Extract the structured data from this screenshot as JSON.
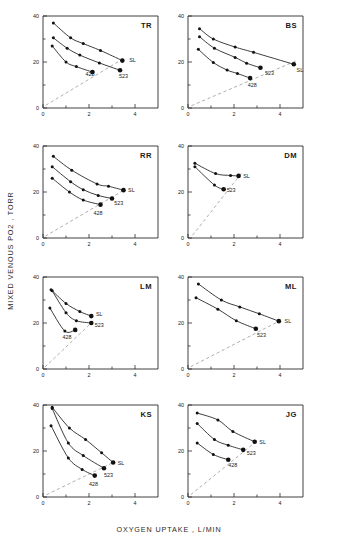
{
  "figure": {
    "xlabel": "OXYGEN UPTAKE , L/MIN",
    "ylabel": "MIXED VENOUS PO2 , TORR",
    "axis_color": "#2b2b2b",
    "marker_color": "#111111",
    "refline_color": "#9a9a9a"
  },
  "chart_data": {
    "type": "scatter",
    "title": "",
    "xlabel": "OXYGEN UPTAKE , L/MIN",
    "ylabel": "MIXED VENOUS PO2 , TORR",
    "xlim": [
      0,
      5
    ],
    "ylim": [
      0,
      40
    ],
    "xticks": [
      0,
      2,
      4
    ],
    "xticks_minor": [
      1,
      3
    ],
    "yticks": [
      0,
      20,
      40
    ],
    "yticks_minor": [
      10,
      30
    ],
    "xtick_labels": [
      "0",
      "2",
      "4"
    ],
    "ytick_labels": [
      "0",
      "20",
      "40"
    ],
    "grid": false,
    "legend": "inline-curve-labels",
    "reference_line": {
      "label": "",
      "style": "dashed",
      "from": [
        0,
        0
      ],
      "to": [
        3.6,
        26
      ]
    },
    "series_names": [
      "SL",
      "523",
      "428"
    ],
    "panels": [
      {
        "name": "TR",
        "row": 0,
        "col": 0,
        "refline": {
          "from": [
            0.12,
            1.2
          ],
          "to": [
            3.5,
            21.5
          ]
        },
        "series": [
          {
            "name": "SL",
            "label_pos": [
              3.75,
              21.0
            ],
            "points": [
              [
                0.45,
                37.0
              ],
              [
                1.2,
                30.5
              ],
              [
                1.75,
                28.0
              ],
              [
                2.5,
                25.0
              ],
              [
                3.45,
                20.6
              ]
            ],
            "endpoint_big": true
          },
          {
            "name": "523",
            "label_pos": [
              3.3,
              14.0
            ],
            "points": [
              [
                0.45,
                30.5
              ],
              [
                1.05,
                26.0
              ],
              [
                1.6,
                23.0
              ],
              [
                2.45,
                19.6
              ],
              [
                3.35,
                16.4
              ]
            ],
            "endpoint_big": true
          },
          {
            "name": "428",
            "label_pos": [
              1.85,
              14.7
            ],
            "points": [
              [
                0.4,
                27.0
              ],
              [
                1.0,
                20.0
              ],
              [
                1.45,
                18.0
              ],
              [
                2.15,
                15.6
              ]
            ],
            "endpoint_big": true
          }
        ]
      },
      {
        "name": "BS",
        "row": 0,
        "col": 1,
        "refline": {
          "from": [
            0.15,
            1.0
          ],
          "to": [
            4.7,
            20.5
          ]
        },
        "series": [
          {
            "name": "SL",
            "label_pos": [
              4.72,
              16.6
            ],
            "points": [
              [
                0.5,
                34.5
              ],
              [
                1.1,
                30.0
              ],
              [
                2.05,
                26.5
              ],
              [
                2.85,
                24.2
              ],
              [
                4.6,
                19.0
              ]
            ],
            "endpoint_big": true
          },
          {
            "name": "523",
            "label_pos": [
              3.35,
              15.4
            ],
            "points": [
              [
                0.5,
                31.0
              ],
              [
                1.15,
                26.0
              ],
              [
                2.05,
                22.0
              ],
              [
                2.55,
                19.5
              ],
              [
                3.15,
                17.5
              ]
            ],
            "endpoint_big": true
          },
          {
            "name": "428",
            "label_pos": [
              2.6,
              10.2
            ],
            "points": [
              [
                0.45,
                25.5
              ],
              [
                1.1,
                19.8
              ],
              [
                1.7,
                16.5
              ],
              [
                2.15,
                15.0
              ],
              [
                2.7,
                13.0
              ]
            ],
            "endpoint_big": true
          }
        ]
      },
      {
        "name": "RR",
        "row": 1,
        "col": 0,
        "refline": {
          "from": [
            0.1,
            0.8
          ],
          "to": [
            3.55,
            21.0
          ]
        },
        "series": [
          {
            "name": "SL",
            "label_pos": [
              3.7,
              21.0
            ],
            "points": [
              [
                0.45,
                35.5
              ],
              [
                1.25,
                29.5
              ],
              [
                2.35,
                23.5
              ],
              [
                2.85,
                22.5
              ],
              [
                3.5,
                20.8
              ]
            ],
            "endpoint_big": true
          },
          {
            "name": "523",
            "label_pos": [
              3.1,
              15.2
            ],
            "points": [
              [
                0.4,
                31.0
              ],
              [
                1.2,
                24.5
              ],
              [
                1.75,
                21.0
              ],
              [
                2.4,
                18.5
              ],
              [
                3.0,
                17.2
              ]
            ],
            "endpoint_big": true
          },
          {
            "name": "428",
            "label_pos": [
              2.2,
              11.0
            ],
            "points": [
              [
                0.4,
                26.0
              ],
              [
                1.15,
                20.0
              ],
              [
                1.75,
                16.5
              ],
              [
                2.5,
                14.5
              ]
            ],
            "endpoint_big": true
          }
        ]
      },
      {
        "name": "DM",
        "row": 1,
        "col": 1,
        "refline": {
          "from": [
            0.2,
            1.2
          ],
          "to": [
            2.35,
            28.5
          ]
        },
        "series": [
          {
            "name": "SL",
            "label_pos": [
              2.4,
              27.0
            ],
            "points": [
              [
                0.3,
                32.5
              ],
              [
                1.2,
                28.0
              ],
              [
                1.85,
                27.2
              ],
              [
                2.2,
                27.0
              ]
            ],
            "endpoint_big": true
          },
          {
            "name": "523",
            "label_pos": [
              1.68,
              21.0
            ],
            "points": [
              [
                0.3,
                31.0
              ],
              [
                1.15,
                23.0
              ],
              [
                1.55,
                21.2
              ]
            ],
            "endpoint_big": true
          }
        ]
      },
      {
        "name": "LM",
        "row": 2,
        "col": 0,
        "refline": {
          "from": [
            0.08,
            0.8
          ],
          "to": [
            2.2,
            21.0
          ]
        },
        "series": [
          {
            "name": "SL",
            "label_pos": [
              2.3,
              24.0
            ],
            "points": [
              [
                0.35,
                34.5
              ],
              [
                1.0,
                28.5
              ],
              [
                1.6,
                25.0
              ],
              [
                2.1,
                23.0
              ]
            ],
            "endpoint_big": true
          },
          {
            "name": "523",
            "label_pos": [
              2.25,
              19.0
            ],
            "points": [
              [
                0.4,
                34.0
              ],
              [
                1.0,
                24.5
              ],
              [
                1.45,
                21.0
              ],
              [
                2.1,
                20.0
              ]
            ],
            "endpoint_big": true
          },
          {
            "name": "428",
            "label_pos": [
              0.85,
              14.0
            ],
            "points": [
              [
                0.3,
                26.5
              ],
              [
                0.95,
                16.5
              ],
              [
                1.4,
                17.0
              ]
            ],
            "endpoint_big": true
          }
        ]
      },
      {
        "name": "ML",
        "row": 2,
        "col": 1,
        "refline": {
          "from": [
            0.12,
            1.0
          ],
          "to": [
            4.0,
            21.0
          ]
        },
        "series": [
          {
            "name": "SL",
            "label_pos": [
              4.2,
              20.8
            ],
            "points": [
              [
                0.45,
                37.0
              ],
              [
                1.45,
                30.0
              ],
              [
                2.25,
                27.0
              ],
              [
                3.1,
                24.0
              ],
              [
                3.95,
                20.8
              ]
            ],
            "endpoint_big": true
          },
          {
            "name": "523",
            "label_pos": [
              3.0,
              14.8
            ],
            "points": [
              [
                0.35,
                31.0
              ],
              [
                1.3,
                26.0
              ],
              [
                2.1,
                21.0
              ],
              [
                2.95,
                17.5
              ]
            ],
            "endpoint_big": true
          }
        ]
      },
      {
        "name": "KS",
        "row": 3,
        "col": 0,
        "refline": {
          "from": [
            0.15,
            1.0
          ],
          "to": [
            3.05,
            15.0
          ]
        },
        "series": [
          {
            "name": "SL",
            "label_pos": [
              3.25,
              14.8
            ],
            "points": [
              [
                0.4,
                39.0
              ],
              [
                1.15,
                30.0
              ],
              [
                1.85,
                25.0
              ],
              [
                2.55,
                19.2
              ],
              [
                3.05,
                15.0
              ]
            ],
            "endpoint_big": true
          },
          {
            "name": "523",
            "label_pos": [
              2.65,
              9.5
            ],
            "points": [
              [
                0.4,
                38.5
              ],
              [
                1.1,
                23.5
              ],
              [
                1.75,
                18.0
              ],
              [
                2.65,
                12.5
              ]
            ],
            "endpoint_big": true
          },
          {
            "name": "428",
            "label_pos": [
              2.0,
              5.8
            ],
            "points": [
              [
                0.35,
                31.0
              ],
              [
                1.1,
                17.0
              ],
              [
                1.7,
                12.0
              ],
              [
                2.25,
                9.3
              ]
            ],
            "endpoint_big": true
          }
        ]
      },
      {
        "name": "JG",
        "row": 3,
        "col": 1,
        "refline": {
          "from": [
            0.12,
            1.0
          ],
          "to": [
            2.95,
            24.0
          ]
        },
        "series": [
          {
            "name": "SL",
            "label_pos": [
              3.1,
              24.0
            ],
            "points": [
              [
                0.4,
                36.5
              ],
              [
                1.3,
                33.5
              ],
              [
                1.95,
                28.5
              ],
              [
                2.9,
                24.0
              ]
            ],
            "endpoint_big": true
          },
          {
            "name": "523",
            "label_pos": [
              2.55,
              19.2
            ],
            "points": [
              [
                0.4,
                32.0
              ],
              [
                1.15,
                25.0
              ],
              [
                1.75,
                22.5
              ],
              [
                2.4,
                20.5
              ]
            ],
            "endpoint_big": true
          },
          {
            "name": "428",
            "label_pos": [
              1.75,
              14.0
            ],
            "points": [
              [
                0.4,
                23.5
              ],
              [
                1.1,
                18.5
              ],
              [
                1.75,
                16.2
              ]
            ],
            "endpoint_big": true
          }
        ]
      }
    ]
  }
}
